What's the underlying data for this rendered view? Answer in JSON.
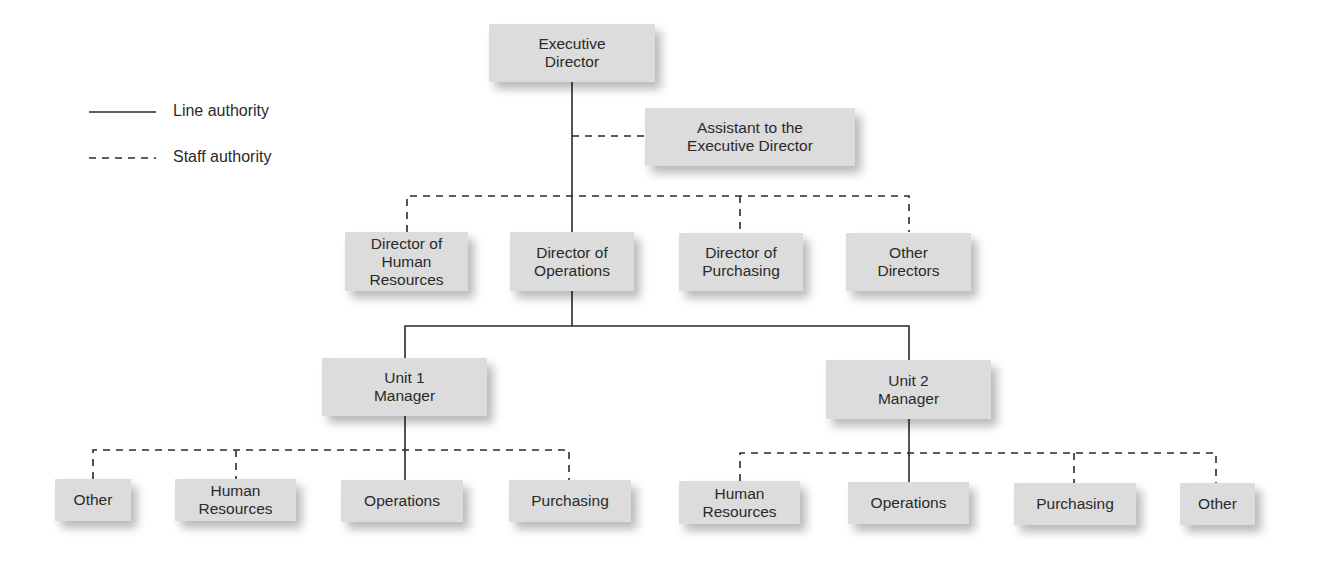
{
  "legend": {
    "line_authority": "Line authority",
    "staff_authority": "Staff authority"
  },
  "nodes": {
    "executive_director": "Executive\nDirector",
    "assistant": "Assistant to the\nExecutive Director",
    "director_hr": "Director of\nHuman\nResources",
    "director_operations": "Director of\nOperations",
    "director_purchasing": "Director of\nPurchasing",
    "other_directors": "Other\nDirectors",
    "unit1_manager": "Unit 1\nManager",
    "unit2_manager": "Unit 2\nManager",
    "unit1_other": "Other",
    "unit1_hr": "Human\nResources",
    "unit1_operations": "Operations",
    "unit1_purchasing": "Purchasing",
    "unit2_hr": "Human\nResources",
    "unit2_operations": "Operations",
    "unit2_purchasing": "Purchasing",
    "unit2_other": "Other"
  },
  "colors": {
    "box_fill": "#dcdcdc",
    "line": "#2a2a2a"
  }
}
